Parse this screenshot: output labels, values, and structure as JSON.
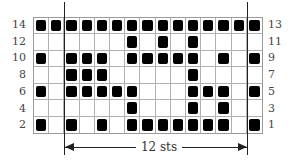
{
  "chart": {
    "columns": 15,
    "rows": [
      {
        "left_label": "14",
        "right_label": "13",
        "filled": [
          1,
          2,
          3,
          4,
          5,
          6,
          7,
          8,
          9,
          10,
          11,
          12,
          13,
          14,
          15
        ]
      },
      {
        "left_label": "12",
        "right_label": "11",
        "filled": [
          7,
          9,
          11
        ]
      },
      {
        "left_label": "10",
        "right_label": "9",
        "filled": [
          1,
          3,
          4,
          5,
          7,
          8,
          9,
          10,
          11,
          13,
          15
        ]
      },
      {
        "left_label": "8",
        "right_label": "7",
        "filled": [
          3,
          4,
          5,
          11
        ]
      },
      {
        "left_label": "6",
        "right_label": "5",
        "filled": [
          1,
          3,
          4,
          5,
          6,
          7,
          11,
          12,
          13,
          15
        ]
      },
      {
        "left_label": "4",
        "right_label": "3",
        "filled": [
          7,
          11,
          13
        ]
      },
      {
        "left_label": "2",
        "right_label": "1",
        "filled": [
          1,
          3,
          5,
          7,
          8,
          9,
          10,
          11,
          12,
          13,
          15
        ]
      }
    ],
    "repeat": {
      "label": "12 sts",
      "start_after_column": 2,
      "end_after_column": 14
    },
    "colors": {
      "filled": "#000000",
      "grid": "#b0b0b0",
      "background": "#ffffff"
    }
  }
}
